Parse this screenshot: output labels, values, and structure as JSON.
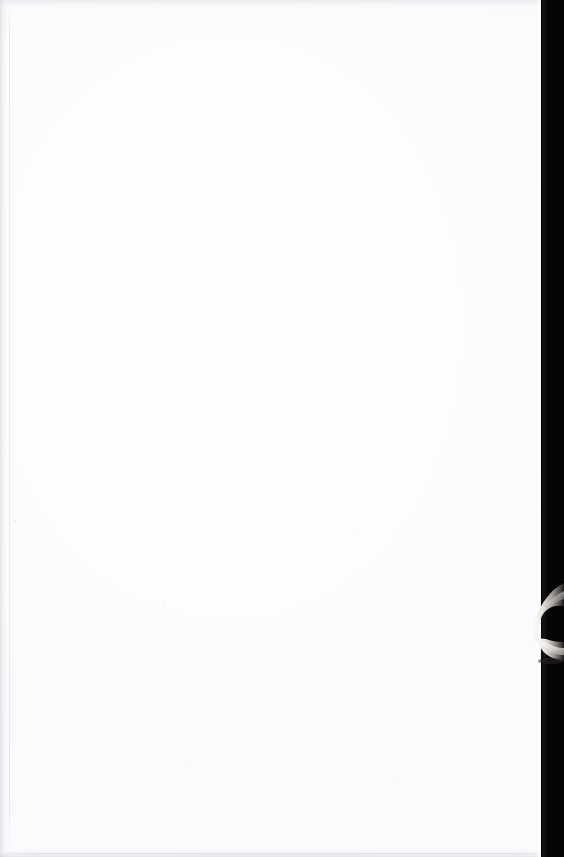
{
  "document": {
    "kind": "scanned-page",
    "page_content": "",
    "page_note": "Blank page",
    "width_px": 564,
    "height_px": 857
  },
  "surface": {
    "paper_label": "Blank paper surface",
    "paper_color": "#fefeff",
    "tone_color": "#fbfbfd"
  },
  "edges": {
    "left_shadow_label": "Left page edge shadow",
    "left_crease_label": "Left margin crease line",
    "top_shadow_label": "Top page edge shadow",
    "bottom_shadow_label": "Bottom page edge shadow",
    "bottom_hairline_label": "Bottom cut hairline",
    "right_highlight_label": "Right page edge highlight",
    "shadow_color": "#cdcdd4",
    "hairline_color": "#babac4"
  },
  "scanner": {
    "void_label": "Scanner void beyond page edge",
    "void_color": "#040404",
    "void_left_px": 541,
    "void_width_px": 23,
    "falloff_label": "Page edge to void falloff"
  },
  "finger": {
    "label": "Finger holding page edge",
    "top_px": 580,
    "left_px": 524,
    "width_px": 40,
    "height_px": 90,
    "highlight_color": "#f2f0ee",
    "midtone_color": "#9a948f",
    "shadow_color": "#2a2726"
  },
  "specks": [
    {
      "x": 14,
      "y": 520,
      "size": 2.0,
      "opacity": 0.42
    },
    {
      "x": 19,
      "y": 525,
      "size": 1.4,
      "opacity": 0.3
    },
    {
      "x": 131,
      "y": 362,
      "size": 2.2,
      "opacity": 0.26
    },
    {
      "x": 265,
      "y": 419,
      "size": 1.6,
      "opacity": 0.22
    },
    {
      "x": 356,
      "y": 435,
      "size": 1.5,
      "opacity": 0.2
    },
    {
      "x": 220,
      "y": 480,
      "size": 1.8,
      "opacity": 0.24
    },
    {
      "x": 226,
      "y": 455,
      "size": 1.3,
      "opacity": 0.2
    },
    {
      "x": 356,
      "y": 529,
      "size": 1.5,
      "opacity": 0.22
    },
    {
      "x": 357,
      "y": 531,
      "size": 1.2,
      "opacity": 0.18
    },
    {
      "x": 163,
      "y": 604,
      "size": 1.9,
      "opacity": 0.25
    },
    {
      "x": 437,
      "y": 594,
      "size": 1.3,
      "opacity": 0.2
    },
    {
      "x": 297,
      "y": 602,
      "size": 1.2,
      "opacity": 0.18
    },
    {
      "x": 360,
      "y": 640,
      "size": 1.4,
      "opacity": 0.19
    },
    {
      "x": 432,
      "y": 625,
      "size": 1.2,
      "opacity": 0.17
    },
    {
      "x": 272,
      "y": 665,
      "size": 1.7,
      "opacity": 0.22
    },
    {
      "x": 188,
      "y": 763,
      "size": 1.5,
      "opacity": 0.2
    },
    {
      "x": 394,
      "y": 782,
      "size": 1.3,
      "opacity": 0.18
    },
    {
      "x": 49,
      "y": 294,
      "size": 1.5,
      "opacity": 0.2
    },
    {
      "x": 479,
      "y": 280,
      "size": 1.4,
      "opacity": 0.19
    },
    {
      "x": 362,
      "y": 209,
      "size": 1.3,
      "opacity": 0.17
    },
    {
      "x": 96,
      "y": 126,
      "size": 1.2,
      "opacity": 0.16
    },
    {
      "x": 508,
      "y": 478,
      "size": 1.3,
      "opacity": 0.18
    },
    {
      "x": 74,
      "y": 698,
      "size": 1.2,
      "opacity": 0.16
    },
    {
      "x": 255,
      "y": 96,
      "size": 1.1,
      "opacity": 0.15
    }
  ]
}
